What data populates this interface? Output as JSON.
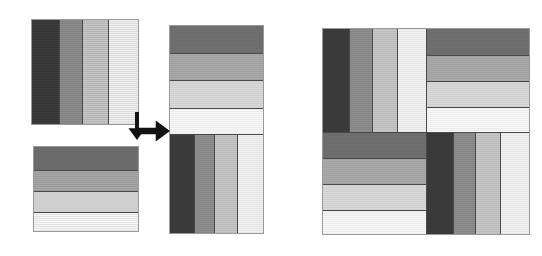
{
  "figure": {
    "background": "#ffffff"
  },
  "palette": {
    "vertical_bands": [
      "#3b3b3b",
      "#8d8d8d",
      "#c6c6c6",
      "#f1f1f1"
    ],
    "horizontal_bands": [
      "#707070",
      "#a9a9a9",
      "#d9d9d9",
      "#f8f8f8"
    ],
    "seam_line": "#4a4a4a",
    "outline": "#9a9a9a",
    "arrow": "#111111"
  },
  "shapes": {
    "source_vertical": {
      "name": "Vertically striped block",
      "x": 31,
      "y": 19,
      "w": 108,
      "h": 106,
      "orientation": "vertical",
      "band_count": 4,
      "band_fractions": [
        0.253,
        0.219,
        0.245,
        0.283
      ],
      "band_colors": [
        "#3b3b3b",
        "#8d8d8d",
        "#c6c6c6",
        "#f1f1f1"
      ]
    },
    "source_horizontal": {
      "name": "Horizontally striped block",
      "x": 33,
      "y": 146,
      "w": 106,
      "h": 86,
      "orientation": "horizontal",
      "band_count": 4,
      "band_fractions": [
        0.27,
        0.255,
        0.245,
        0.23
      ],
      "band_colors": [
        "#707070",
        "#a9a9a9",
        "#d9d9d9",
        "#f8f8f8"
      ]
    },
    "combined_rectangle": {
      "name": "Combined two-block rectangle",
      "x": 169,
      "y": 25,
      "w": 95,
      "h": 209,
      "parts": [
        {
          "name": "top-half-horizontal",
          "orientation": "horizontal",
          "height_fraction": 0.52,
          "band_fractions": [
            0.255,
            0.25,
            0.255,
            0.24
          ],
          "band_colors": [
            "#707070",
            "#a9a9a9",
            "#d9d9d9",
            "#f8f8f8"
          ]
        },
        {
          "name": "bottom-half-vertical",
          "orientation": "vertical",
          "height_fraction": 0.48,
          "band_fractions": [
            0.253,
            0.219,
            0.245,
            0.283
          ],
          "band_colors": [
            "#3b3b3b",
            "#8d8d8d",
            "#c6c6c6",
            "#f1f1f1"
          ]
        }
      ]
    },
    "pinwheel_square": {
      "name": "Four-block pinwheel square",
      "x": 322,
      "y": 28,
      "w": 208,
      "h": 207,
      "split_x_fraction": 0.5,
      "split_y_fraction": 0.5,
      "quadrants": [
        {
          "name": "top-left-quadrant",
          "position": "top-left",
          "orientation": "vertical",
          "band_fractions": [
            0.253,
            0.219,
            0.245,
            0.283
          ],
          "band_colors": [
            "#3b3b3b",
            "#8d8d8d",
            "#c6c6c6",
            "#f1f1f1"
          ]
        },
        {
          "name": "top-right-quadrant",
          "position": "top-right",
          "orientation": "horizontal",
          "band_fractions": [
            0.255,
            0.25,
            0.255,
            0.24
          ],
          "band_colors": [
            "#707070",
            "#a9a9a9",
            "#d9d9d9",
            "#f8f8f8"
          ]
        },
        {
          "name": "bottom-left-quadrant",
          "position": "bottom-left",
          "orientation": "horizontal",
          "band_fractions": [
            0.255,
            0.25,
            0.255,
            0.24
          ],
          "band_colors": [
            "#707070",
            "#a9a9a9",
            "#d9d9d9",
            "#f8f8f8"
          ]
        },
        {
          "name": "bottom-right-quadrant",
          "position": "bottom-right",
          "orientation": "vertical",
          "band_fractions": [
            0.253,
            0.219,
            0.245,
            0.283
          ],
          "band_colors": [
            "#3b3b3b",
            "#8d8d8d",
            "#c6c6c6",
            "#f1f1f1"
          ]
        }
      ]
    }
  },
  "arrows": [
    {
      "name": "down-arrow",
      "direction": "down",
      "x": 128,
      "y": 112,
      "w": 18,
      "h": 28
    },
    {
      "name": "right-arrow",
      "direction": "right",
      "x": 136,
      "y": 120,
      "w": 34,
      "h": 22
    }
  ]
}
